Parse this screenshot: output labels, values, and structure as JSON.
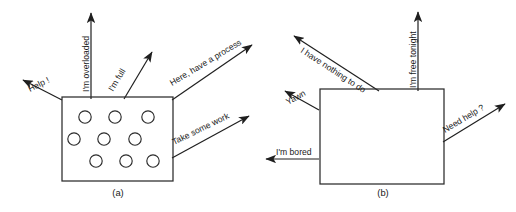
{
  "figure": {
    "background_color": "#ffffff",
    "line_color": "#2b2b2b",
    "text_color": "#1a1a1a",
    "panels": [
      {
        "caption": "(a)",
        "caption_x": 118,
        "caption_y": 196,
        "box": {
          "x": 62,
          "y": 97,
          "width": 111,
          "height": 84
        },
        "circles": {
          "count": 9,
          "radius": 6.2,
          "rows": [
            [
              {
                "cx": 85,
                "cy": 117
              },
              {
                "cx": 115,
                "cy": 117
              },
              {
                "cx": 148,
                "cy": 117
              }
            ],
            [
              {
                "cx": 74,
                "cy": 139
              },
              {
                "cx": 104,
                "cy": 139
              },
              {
                "cx": 135,
                "cy": 139
              }
            ],
            [
              {
                "cx": 96,
                "cy": 161
              },
              {
                "cx": 126,
                "cy": 161
              },
              {
                "cx": 153,
                "cy": 161
              }
            ]
          ]
        },
        "arrows": [
          {
            "label": "Help !",
            "from": {
              "x": 62,
              "y": 100
            },
            "to": {
              "x": 23,
              "y": 80
            },
            "text_x": 30,
            "text_y": 92,
            "rotate": -27
          },
          {
            "label": "I'm overloaded",
            "from": {
              "x": 91,
              "y": 99
            },
            "to": {
              "x": 91,
              "y": 13
            },
            "text_x": 89,
            "text_y": 92,
            "rotate": -90
          },
          {
            "label": "I'm full",
            "from": {
              "x": 124,
              "y": 99
            },
            "to": {
              "x": 152,
              "y": 52
            },
            "text_x": 113,
            "text_y": 92,
            "rotate": -59
          },
          {
            "label": "Here, have a process",
            "from": {
              "x": 172,
              "y": 100
            },
            "to": {
              "x": 252,
              "y": 45
            },
            "text_x": 172,
            "text_y": 86,
            "rotate": -31
          },
          {
            "label": "Take some work",
            "from": {
              "x": 172,
              "y": 158
            },
            "to": {
              "x": 249,
              "y": 116
            },
            "text_x": 174,
            "text_y": 145,
            "rotate": -26
          }
        ]
      },
      {
        "caption": "(b)",
        "caption_x": 383,
        "caption_y": 196,
        "box": {
          "x": 320,
          "y": 89,
          "width": 124,
          "height": 95
        },
        "circles": {
          "count": 0,
          "radius": 0,
          "rows": []
        },
        "arrows": [
          {
            "label": "I have nothing to do",
            "from": {
              "x": 379,
              "y": 91
            },
            "to": {
              "x": 294,
              "y": 36
            },
            "text_x": 300,
            "text_y": 52,
            "rotate": 33
          },
          {
            "label": "I'm free tonight",
            "from": {
              "x": 418,
              "y": 91
            },
            "to": {
              "x": 418,
              "y": 12
            },
            "text_x": 416,
            "text_y": 88,
            "rotate": -90
          },
          {
            "label": "Yawn",
            "from": {
              "x": 319,
              "y": 110
            },
            "to": {
              "x": 285,
              "y": 91
            },
            "text_x": 288,
            "text_y": 105,
            "rotate": -29
          },
          {
            "label": "Need help ?",
            "from": {
              "x": 443,
              "y": 142
            },
            "to": {
              "x": 505,
              "y": 104
            },
            "text_x": 445,
            "text_y": 133,
            "rotate": -31
          },
          {
            "label": "I'm bored",
            "from": {
              "x": 319,
              "y": 159
            },
            "to": {
              "x": 266,
              "y": 159
            },
            "text_x": 276,
            "text_y": 155,
            "rotate": 0
          }
        ]
      }
    ]
  }
}
